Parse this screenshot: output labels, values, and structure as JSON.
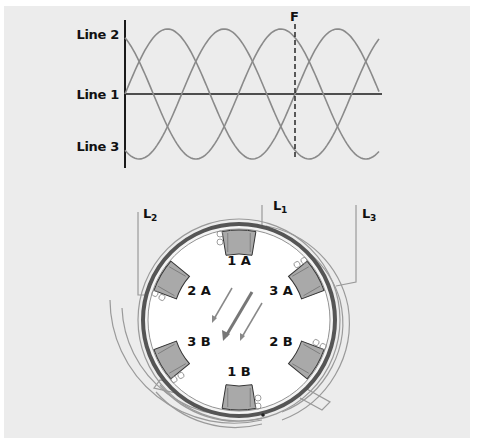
{
  "figure": {
    "panel_color": "#ececec",
    "wave_color": "#8a8a8a",
    "axis_color": "#1a1a1a"
  },
  "waveform": {
    "labels": {
      "line2": "Line 2",
      "line1": "Line 1",
      "line3": "Line 3",
      "marker": "F"
    }
  },
  "motor": {
    "leads": {
      "l1": "L",
      "l1_sub": "1",
      "l2": "L",
      "l2_sub": "2",
      "l3": "L",
      "l3_sub": "3"
    },
    "coils": [
      {
        "id": "1A",
        "label": "1 A"
      },
      {
        "id": "2A",
        "label": "2 A"
      },
      {
        "id": "3A",
        "label": "3 A"
      },
      {
        "id": "3B",
        "label": "3 B"
      },
      {
        "id": "2B",
        "label": "2 B"
      },
      {
        "id": "1B",
        "label": "1 B"
      }
    ],
    "coil_color": "#a9a9a9",
    "frame_color": "#555555"
  },
  "chart_data": {
    "type": "line",
    "title": "",
    "xlabel": "",
    "ylabel": "",
    "series": [
      {
        "name": "Line 1",
        "phase_deg": 0,
        "values_at_F": 0
      },
      {
        "name": "Line 2",
        "phase_deg": 120,
        "values_at_F": 0.866
      },
      {
        "name": "Line 3",
        "phase_deg": -120,
        "values_at_F": -0.866
      }
    ],
    "x_cycles": 1.5,
    "amplitude": 1,
    "annotations": [
      {
        "label": "F",
        "x_cycle": 1.0,
        "style": "dashed vertical"
      }
    ],
    "ytick_labels": [
      "Line 2",
      "Line 1",
      "Line 3"
    ],
    "grid": false
  }
}
